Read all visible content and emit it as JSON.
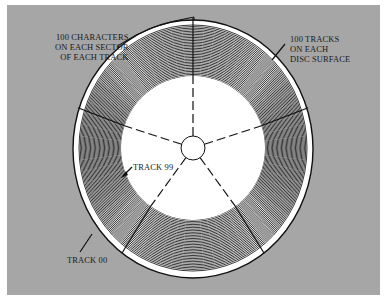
{
  "figure": {
    "type": "disc track/sector diagram",
    "background_color": "#a6a6a6",
    "disc": {
      "center": [
        193,
        148
      ],
      "outer_radius_x": 119,
      "outer_radius_y": 128,
      "inner_hole_radius_x": 72,
      "inner_hole_radius_y": 72,
      "hub_radius": 12,
      "track_line_count": 34,
      "sector_count": 5,
      "sector_angles_deg": [
        90,
        162,
        18,
        234,
        306
      ]
    },
    "labels": {
      "characters_line1": "100 CHARACTERS",
      "characters_line2": "ON EACH SECTOR",
      "characters_line3": "OF EACH TRACK",
      "tracks_line1": "100 TRACKS",
      "tracks_line2": "ON EACH",
      "tracks_line3": "DISC SURFACE",
      "track99": "TRACK 99",
      "track00": "TRACK 00"
    }
  }
}
